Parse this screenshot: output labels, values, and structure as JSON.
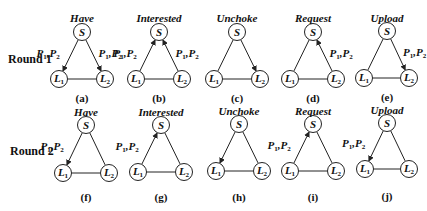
{
  "figure": {
    "rows": [
      {
        "label": "Round 1",
        "label_pos": {
          "x": 8,
          "y": 52
        },
        "panels": [
          {
            "id": "a",
            "title": "Have",
            "caption": "(a)",
            "S": [
              82,
              32
            ],
            "L1": [
              59,
              79
            ],
            "L2": [
              105,
              79
            ],
            "edges": [
              {
                "from": "S",
                "to": "L1",
                "arrow": true,
                "label": "P1,P2",
                "label_side": "left"
              },
              {
                "from": "S",
                "to": "L2",
                "arrow": true,
                "label": "P1,P2",
                "label_side": "right"
              },
              {
                "from": "L1",
                "to": "L2",
                "arrow": false
              }
            ],
            "title_y": 12,
            "caption_y": 92
          },
          {
            "id": "b",
            "title": "Interested",
            "caption": "(b)",
            "S": [
              159,
              32
            ],
            "L1": [
              136,
              79
            ],
            "L2": [
              182,
              79
            ],
            "edges": [
              {
                "from": "L1",
                "to": "S",
                "arrow": true,
                "label": "P1,P2",
                "label_side": "left"
              },
              {
                "from": "L2",
                "to": "S",
                "arrow": true,
                "label": "P1,P2",
                "label_side": "right"
              },
              {
                "from": "L1",
                "to": "L2",
                "arrow": false
              }
            ],
            "title_y": 12,
            "caption_y": 92
          },
          {
            "id": "c",
            "title": "Unchoke",
            "caption": "(c)",
            "S": [
              237,
              32
            ],
            "L1": [
              214,
              79
            ],
            "L2": [
              260,
              79
            ],
            "edges": [
              {
                "from": "S",
                "to": "L1",
                "arrow": false
              },
              {
                "from": "S",
                "to": "L2",
                "arrow": true
              },
              {
                "from": "L1",
                "to": "L2",
                "arrow": false
              }
            ],
            "title_y": 12,
            "caption_y": 92
          },
          {
            "id": "d",
            "title": "Request",
            "caption": "(d)",
            "S": [
              313,
              32
            ],
            "L1": [
              290,
              79
            ],
            "L2": [
              336,
              79
            ],
            "edges": [
              {
                "from": "S",
                "to": "L1",
                "arrow": false
              },
              {
                "from": "L2",
                "to": "S",
                "arrow": true,
                "label": "P1,P2",
                "label_side": "right"
              },
              {
                "from": "L1",
                "to": "L2",
                "arrow": false
              }
            ],
            "title_y": 12,
            "caption_y": 92
          },
          {
            "id": "e",
            "title": "Upload",
            "caption": "(e)",
            "S": [
              387,
              31
            ],
            "L1": [
              364,
              78
            ],
            "L2": [
              409,
              78
            ],
            "edges": [
              {
                "from": "S",
                "to": "L1",
                "arrow": false
              },
              {
                "from": "S",
                "to": "L2",
                "arrow": true,
                "label": "P1,P2",
                "label_side": "right"
              },
              {
                "from": "L1",
                "to": "L2",
                "arrow": false
              }
            ],
            "title_y": 12,
            "caption_y": 91
          }
        ]
      },
      {
        "label": "Round 2",
        "label_pos": {
          "x": 10,
          "y": 144
        },
        "panels": [
          {
            "id": "f",
            "title": "Have",
            "caption": "(f)",
            "S": [
              86,
              125
            ],
            "L1": [
              63,
              173
            ],
            "L2": [
              109,
              173
            ],
            "edges": [
              {
                "from": "S",
                "to": "L1",
                "arrow": true,
                "label": "P1,P2",
                "label_side": "left"
              },
              {
                "from": "S",
                "to": "L2",
                "arrow": false
              },
              {
                "from": "L1",
                "to": "L2",
                "arrow": false
              }
            ],
            "title_y": 106,
            "caption_y": 191
          },
          {
            "id": "g",
            "title": "Interested",
            "caption": "(g)",
            "S": [
              161,
              125
            ],
            "L1": [
              138,
              172
            ],
            "L2": [
              184,
              172
            ],
            "edges": [
              {
                "from": "L1",
                "to": "S",
                "arrow": true,
                "label": "P1,P2",
                "label_side": "left"
              },
              {
                "from": "S",
                "to": "L2",
                "arrow": false
              },
              {
                "from": "L1",
                "to": "L2",
                "arrow": false
              }
            ],
            "title_y": 106,
            "caption_y": 191
          },
          {
            "id": "h",
            "title": "Unchoke",
            "caption": "(h)",
            "S": [
              239,
              124
            ],
            "L1": [
              216,
              171
            ],
            "L2": [
              262,
              171
            ],
            "edges": [
              {
                "from": "S",
                "to": "L1",
                "arrow": true
              },
              {
                "from": "S",
                "to": "L2",
                "arrow": false
              },
              {
                "from": "L1",
                "to": "L2",
                "arrow": false
              }
            ],
            "title_y": 105,
            "caption_y": 191
          },
          {
            "id": "i",
            "title": "Request",
            "caption": "(i)",
            "S": [
              313,
              124
            ],
            "L1": [
              290,
              171
            ],
            "L2": [
              336,
              171
            ],
            "edges": [
              {
                "from": "L1",
                "to": "S",
                "arrow": true,
                "label": "P1,P2",
                "label_side": "left"
              },
              {
                "from": "S",
                "to": "L2",
                "arrow": false
              },
              {
                "from": "L1",
                "to": "L2",
                "arrow": false
              }
            ],
            "title_y": 105,
            "caption_y": 191
          },
          {
            "id": "j",
            "title": "Upload",
            "caption": "(j)",
            "S": [
              387,
              123
            ],
            "L1": [
              365,
              169
            ],
            "L2": [
              409,
              169
            ],
            "edges": [
              {
                "from": "S",
                "to": "L1",
                "arrow": true,
                "label": "P1,P2",
                "label_side": "left"
              },
              {
                "from": "S",
                "to": "L2",
                "arrow": false
              },
              {
                "from": "L1",
                "to": "L2",
                "arrow": false
              }
            ],
            "title_y": 104,
            "caption_y": 190
          }
        ]
      }
    ],
    "node_labels": {
      "S": "S",
      "L1": "L",
      "L1_sub": "1",
      "L2": "L",
      "L2_sub": "2"
    },
    "edge_label_parts": {
      "p1": "P",
      "p1_sub": "1",
      "sep": ",",
      "p2": "P",
      "p2_sub": "2"
    },
    "style": {
      "stroke": "#222222",
      "node_radius": 8.5
    }
  }
}
